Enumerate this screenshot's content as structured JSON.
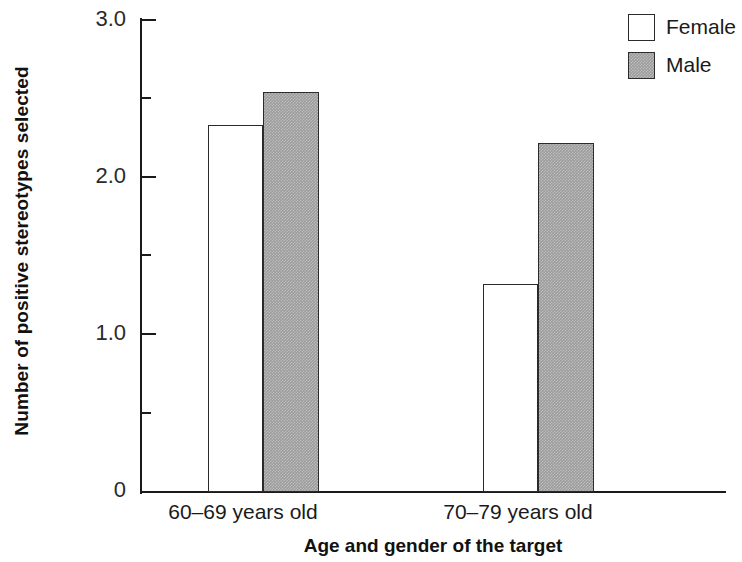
{
  "chart_data": {
    "type": "bar",
    "title": "",
    "xlabel": "Age and gender of the target",
    "ylabel": "Number of positive stereotypes selected",
    "categories": [
      "60–69 years old",
      "70–79 years old"
    ],
    "series": [
      {
        "name": "Female",
        "values": [
          2.33,
          1.32
        ],
        "fill": "#ffffff",
        "border": "#2b2b2b"
      },
      {
        "name": "Male",
        "values": [
          2.54,
          2.22
        ],
        "fill": "#9b9b9b",
        "border": "#2b2b2b"
      }
    ],
    "ylim": [
      0,
      3.0
    ],
    "y_major_ticks": [
      0,
      1.0,
      2.0,
      3.0
    ],
    "y_major_tick_labels": [
      "0",
      "1.0",
      "2.0",
      "3.0"
    ],
    "y_minor_ticks": [
      0.5,
      1.5,
      2.5
    ],
    "grid": false,
    "legend_position": "top-right",
    "legend_entries": [
      "Female",
      "Male"
    ]
  },
  "axes": {
    "y_labels": [
      {
        "text": "3.0",
        "value": 3.0
      },
      {
        "text": "2.0",
        "value": 2.0
      },
      {
        "text": "1.0",
        "value": 1.0
      },
      {
        "text": "0",
        "value": 0
      }
    ],
    "y_title": "Number of positive stereotypes selected",
    "x_title": "Age and gender of the target",
    "x_categories": [
      "60–69 years old",
      "70–79 years old"
    ]
  },
  "legend": {
    "items": [
      {
        "label": "Female",
        "swatch": "legend-swatch-female"
      },
      {
        "label": "Male",
        "swatch": "legend-swatch-male"
      }
    ]
  }
}
